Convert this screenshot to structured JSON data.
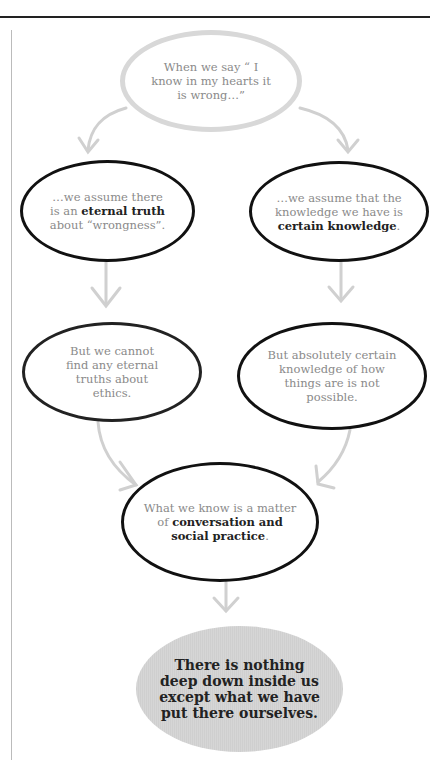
{
  "diagram": {
    "nodes": [
      {
        "id": "start",
        "parts": [
          {
            "t": "When we say “ I know in my hearts it is wrong…”",
            "b": false
          }
        ]
      },
      {
        "id": "left-1",
        "parts": [
          {
            "t": "…we assume there is an ",
            "b": false
          },
          {
            "t": "eternal truth",
            "b": true
          },
          {
            "t": " about “wrongness”.",
            "b": false
          }
        ]
      },
      {
        "id": "right-1",
        "parts": [
          {
            "t": "…we assume that the knowledge we have is ",
            "b": false
          },
          {
            "t": "certain knowledge",
            "b": true
          },
          {
            "t": ".",
            "b": false
          }
        ]
      },
      {
        "id": "left-2",
        "parts": [
          {
            "t": "But we cannot find any eternal truths about ethics.",
            "b": false
          }
        ]
      },
      {
        "id": "right-2",
        "parts": [
          {
            "t": "But absolutely certain knowledge of how things are is not possible.",
            "b": false
          }
        ]
      },
      {
        "id": "merge",
        "parts": [
          {
            "t": "What we know is a matter of ",
            "b": false
          },
          {
            "t": "conversation and social practice",
            "b": true
          },
          {
            "t": ".",
            "b": false
          }
        ]
      },
      {
        "id": "conclusion",
        "parts": [
          {
            "t": "There is nothing deep down inside us except what we have put there ourselves.",
            "b": true
          }
        ]
      }
    ],
    "colors": {
      "arrow": "#d0d0d0",
      "outline": "#111111",
      "start_outline": "#d8d8d8",
      "conclusion_fill": "#d3d3d3"
    }
  }
}
